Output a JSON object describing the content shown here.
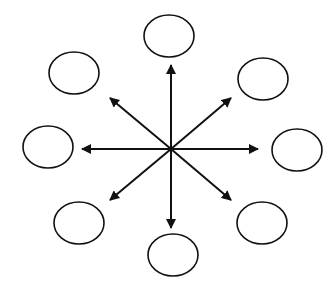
{
  "diagram": {
    "type": "hub-and-spoke",
    "stroke_color": "#111111",
    "background": "#ffffff",
    "hub": {
      "x": 171,
      "y": 149
    },
    "nodes": [
      {
        "id": "top",
        "cx": 169,
        "cy": 36,
        "rx": 25,
        "ry": 21,
        "label": ""
      },
      {
        "id": "upper-right",
        "cx": 263,
        "cy": 79,
        "rx": 25,
        "ry": 21,
        "label": ""
      },
      {
        "id": "right",
        "cx": 297,
        "cy": 150,
        "rx": 25,
        "ry": 21,
        "label": ""
      },
      {
        "id": "lower-right",
        "cx": 262,
        "cy": 223,
        "rx": 25,
        "ry": 21,
        "label": ""
      },
      {
        "id": "bottom",
        "cx": 173,
        "cy": 255,
        "rx": 25,
        "ry": 21,
        "label": ""
      },
      {
        "id": "lower-left",
        "cx": 79,
        "cy": 223,
        "rx": 25,
        "ry": 21,
        "label": ""
      },
      {
        "id": "left",
        "cx": 48,
        "cy": 147,
        "rx": 25,
        "ry": 21,
        "label": ""
      },
      {
        "id": "upper-left",
        "cx": 74,
        "cy": 73,
        "rx": 25,
        "ry": 21,
        "label": ""
      }
    ],
    "arrows": [
      {
        "id": "up",
        "x2": 171,
        "y2": 65
      },
      {
        "id": "up-right",
        "x2": 231,
        "y2": 98
      },
      {
        "id": "right",
        "x2": 258,
        "y2": 149
      },
      {
        "id": "down-right",
        "x2": 231,
        "y2": 200
      },
      {
        "id": "down",
        "x2": 171,
        "y2": 228
      },
      {
        "id": "down-left",
        "x2": 110,
        "y2": 200
      },
      {
        "id": "left",
        "x2": 82,
        "y2": 149
      },
      {
        "id": "up-left",
        "x2": 110,
        "y2": 98
      }
    ]
  }
}
